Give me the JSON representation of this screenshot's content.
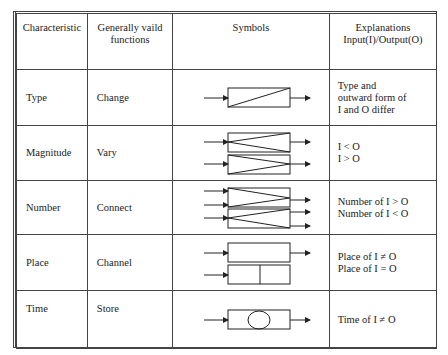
{
  "table": {
    "headers": [
      "Characteristic",
      "Generally vaild functions",
      "Symbols",
      "Explanations Input(I)/Output(O)"
    ],
    "header_lines": {
      "col2": [
        "Generally vaild",
        "functions"
      ],
      "col4": [
        "Explanations",
        "Input(I)/Output(O)"
      ]
    },
    "rows": [
      {
        "characteristic": "Type",
        "function": "Change",
        "symbol": "box-diagonal-icon",
        "explanation": [
          "Type and",
          "outward form of",
          "I and O differ"
        ]
      },
      {
        "characteristic": "Magnitude",
        "function": "Vary",
        "symbol": "box-vary-icon",
        "explanation": [
          "I < O",
          "I > O"
        ]
      },
      {
        "characteristic": "Number",
        "function": "Connect",
        "symbol": "box-connect-icon",
        "explanation": [
          "Number of I > O",
          "Number of I < O"
        ]
      },
      {
        "characteristic": "Place",
        "function": "Channel",
        "symbol": "box-channel-icon",
        "explanation": [
          "Place of I ≠ O",
          "Place of I = O"
        ]
      },
      {
        "characteristic": "Time",
        "function": "Store",
        "symbol": "box-store-icon",
        "explanation": [
          "Time of I ≠ O"
        ]
      }
    ]
  }
}
